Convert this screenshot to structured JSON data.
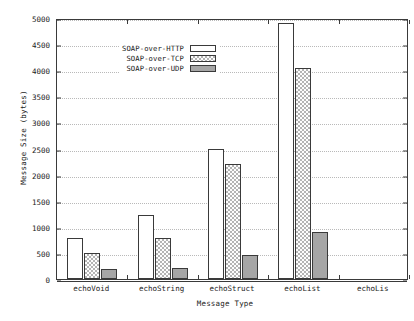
{
  "chart_data": {
    "type": "bar",
    "title": "",
    "xlabel": "Message Type",
    "ylabel": "Message Size (bytes)",
    "categories": [
      "echoVoid",
      "echoString",
      "echoStruct",
      "echoList",
      "echoLis"
    ],
    "series": [
      {
        "name": "SOAP-over-HTTP",
        "values": [
          780,
          1220,
          2500,
          4900,
          null
        ],
        "fill": "empty"
      },
      {
        "name": "SOAP-over-TCP",
        "values": [
          500,
          790,
          2210,
          4050,
          null
        ],
        "fill": "checker"
      },
      {
        "name": "SOAP-over-UDP",
        "values": [
          190,
          220,
          460,
          900,
          null
        ],
        "fill": "solid"
      }
    ],
    "ylim": [
      0,
      5000
    ],
    "yticks": [
      0,
      500,
      1000,
      1500,
      2000,
      2500,
      3000,
      3500,
      4000,
      4500,
      5000
    ],
    "ytick_labels": [
      "0",
      "500",
      "1000",
      "1500",
      "2000",
      "2500",
      "3000",
      "3500",
      "4000",
      "4500",
      "5000"
    ],
    "grid": true,
    "grid_style": "dotted-horizontal",
    "legend_position": "top-left-inside",
    "note_last_category_clipped": "echoLis"
  },
  "colors": {
    "axis": "#3a3a3a",
    "grid": "#b9b9b9",
    "text": "#1a1a1a",
    "background": "#ffffff",
    "series_empty": "#ffffff",
    "series_checker": "#b4b4b4",
    "series_solid": "#a6a6a6"
  }
}
